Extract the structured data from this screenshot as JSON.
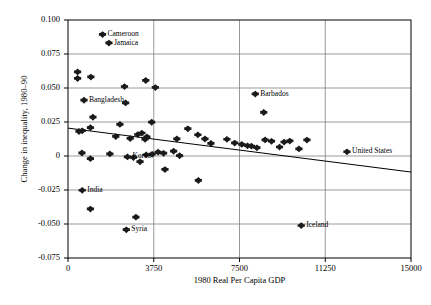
{
  "chart_data": {
    "type": "scatter",
    "title": "",
    "xlabel": "1980 Real Per Capita GDP",
    "ylabel": "Change in inequality, 1980–90",
    "xlim": [
      0,
      15000
    ],
    "ylim": [
      -0.075,
      0.1
    ],
    "xticks": [
      "0",
      "3750",
      "7500",
      "11250",
      "15000"
    ],
    "xtick_values": [
      0,
      3750,
      7500,
      11250,
      15000
    ],
    "yticks": [
      "0.100",
      "0.075",
      "0.050",
      "0.025",
      "0",
      "-0.025",
      "-0.050",
      "-0.075"
    ],
    "ytick_values": [
      0.1,
      0.075,
      0.05,
      0.025,
      0,
      -0.025,
      -0.05,
      -0.075
    ],
    "grid": "both",
    "legend": "none",
    "marker": "diamond-plus",
    "trendline": {
      "x0": 0,
      "y0": 0.0205,
      "x1": 15000,
      "y1": -0.0118
    },
    "annotations": [
      {
        "label": "Cameroon",
        "x": 1510,
        "y": 0.0893
      },
      {
        "label": "Jamaica",
        "x": 1790,
        "y": 0.083
      },
      {
        "label": "Bangladesh",
        "x": 700,
        "y": 0.041
      },
      {
        "label": "Barbados",
        "x": 8190,
        "y": 0.0455
      },
      {
        "label": "Korea",
        "x": 2600,
        "y": -0.0007
      },
      {
        "label": "United States",
        "x": 12200,
        "y": 0.003
      },
      {
        "label": "India",
        "x": 620,
        "y": -0.0253
      },
      {
        "label": "Syria",
        "x": 2550,
        "y": -0.0543
      },
      {
        "label": "Iceland",
        "x": 10200,
        "y": -0.0512
      }
    ],
    "points": [
      {
        "x": 1510,
        "y": 0.0893,
        "label": "Cameroon"
      },
      {
        "x": 1790,
        "y": 0.083,
        "label": "Jamaica"
      },
      {
        "x": 420,
        "y": 0.0618
      },
      {
        "x": 420,
        "y": 0.057
      },
      {
        "x": 1000,
        "y": 0.058
      },
      {
        "x": 2470,
        "y": 0.051
      },
      {
        "x": 3400,
        "y": 0.0555
      },
      {
        "x": 3820,
        "y": 0.0503
      },
      {
        "x": 700,
        "y": 0.041,
        "label": "Bangladesh"
      },
      {
        "x": 2520,
        "y": 0.039
      },
      {
        "x": 8190,
        "y": 0.0455,
        "label": "Barbados"
      },
      {
        "x": 8560,
        "y": 0.032
      },
      {
        "x": 1090,
        "y": 0.0285
      },
      {
        "x": 2270,
        "y": 0.0232
      },
      {
        "x": 3660,
        "y": 0.0248
      },
      {
        "x": 480,
        "y": 0.018
      },
      {
        "x": 620,
        "y": 0.0185
      },
      {
        "x": 980,
        "y": 0.0208
      },
      {
        "x": 2090,
        "y": 0.0143
      },
      {
        "x": 2720,
        "y": 0.0128
      },
      {
        "x": 3050,
        "y": 0.0157
      },
      {
        "x": 3230,
        "y": 0.0168
      },
      {
        "x": 3450,
        "y": 0.014
      },
      {
        "x": 3370,
        "y": 0.0122
      },
      {
        "x": 4760,
        "y": 0.0125
      },
      {
        "x": 5240,
        "y": 0.02
      },
      {
        "x": 5680,
        "y": 0.0155
      },
      {
        "x": 5990,
        "y": 0.0125
      },
      {
        "x": 6250,
        "y": 0.0092
      },
      {
        "x": 6950,
        "y": 0.0122
      },
      {
        "x": 7290,
        "y": 0.0095
      },
      {
        "x": 7600,
        "y": 0.0085
      },
      {
        "x": 7850,
        "y": 0.0075
      },
      {
        "x": 8020,
        "y": 0.0072
      },
      {
        "x": 8260,
        "y": 0.006
      },
      {
        "x": 8620,
        "y": 0.0118
      },
      {
        "x": 8900,
        "y": 0.0108
      },
      {
        "x": 9250,
        "y": 0.0065
      },
      {
        "x": 9450,
        "y": 0.0102
      },
      {
        "x": 9700,
        "y": 0.011
      },
      {
        "x": 10450,
        "y": 0.0117
      },
      {
        "x": 10100,
        "y": 0.0052
      },
      {
        "x": 610,
        "y": 0.0022
      },
      {
        "x": 980,
        "y": -0.002
      },
      {
        "x": 1830,
        "y": 0.0015
      },
      {
        "x": 2600,
        "y": -0.0007,
        "label": "Korea"
      },
      {
        "x": 2860,
        "y": -0.0012
      },
      {
        "x": 3150,
        "y": -0.0043
      },
      {
        "x": 3420,
        "y": 0.0008
      },
      {
        "x": 3680,
        "y": 0.0012
      },
      {
        "x": 3940,
        "y": 0.0028
      },
      {
        "x": 4180,
        "y": 0.002
      },
      {
        "x": 4620,
        "y": 0.0035
      },
      {
        "x": 4880,
        "y": 0.0002
      },
      {
        "x": 12200,
        "y": 0.003,
        "label": "United States"
      },
      {
        "x": 4240,
        "y": -0.01
      },
      {
        "x": 5700,
        "y": -0.018
      },
      {
        "x": 620,
        "y": -0.0253,
        "label": "India"
      },
      {
        "x": 980,
        "y": -0.039
      },
      {
        "x": 2970,
        "y": -0.045
      },
      {
        "x": 2550,
        "y": -0.0543,
        "label": "Syria"
      },
      {
        "x": 10200,
        "y": -0.0512,
        "label": "Iceland"
      }
    ]
  },
  "colors": {
    "axis": "#000000",
    "grid": "#808080",
    "marker": "#1a1a1a",
    "trend": "#000000",
    "background": "#ffffff"
  }
}
